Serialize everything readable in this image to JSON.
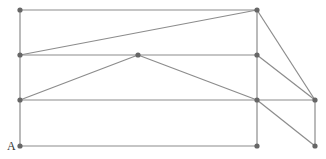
{
  "diagram": {
    "line_color": "#8c8c8c",
    "point_color": "#666666",
    "labels": [
      {
        "text": "A",
        "x": 7,
        "y": 139
      }
    ],
    "points": [
      {
        "id": "p1",
        "x": 20,
        "y": 10
      },
      {
        "id": "p2",
        "x": 257,
        "y": 10
      },
      {
        "id": "p3",
        "x": 20,
        "y": 55
      },
      {
        "id": "p4",
        "x": 138,
        "y": 55
      },
      {
        "id": "p5",
        "x": 257,
        "y": 55
      },
      {
        "id": "p6",
        "x": 20,
        "y": 100
      },
      {
        "id": "p7",
        "x": 257,
        "y": 100
      },
      {
        "id": "p8",
        "x": 315,
        "y": 100
      },
      {
        "id": "A",
        "x": 20,
        "y": 146
      },
      {
        "id": "p10",
        "x": 257,
        "y": 146
      },
      {
        "id": "p11",
        "x": 315,
        "y": 146
      }
    ],
    "segments": [
      [
        20,
        10,
        257,
        10
      ],
      [
        20,
        55,
        257,
        55
      ],
      [
        20,
        100,
        315,
        100
      ],
      [
        20,
        146,
        257,
        146
      ],
      [
        20,
        10,
        20,
        146
      ],
      [
        257,
        10,
        257,
        146
      ],
      [
        315,
        100,
        315,
        146
      ],
      [
        20,
        55,
        257,
        10
      ],
      [
        20,
        100,
        138,
        55
      ],
      [
        138,
        55,
        257,
        100
      ],
      [
        257,
        100,
        315,
        146
      ],
      [
        257,
        10,
        315,
        100
      ],
      [
        257,
        55,
        315,
        100
      ]
    ]
  }
}
